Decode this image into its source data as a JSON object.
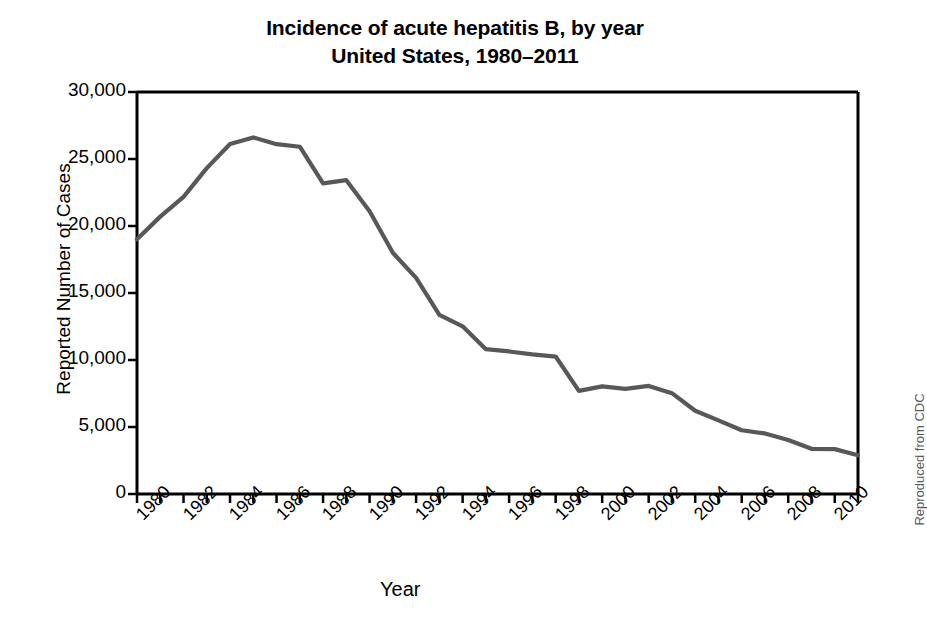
{
  "chart_data": {
    "type": "line",
    "title": "Incidence of acute hepatitis B, by year United States, 1980–2011",
    "title_lines": [
      "Incidence of acute hepatitis B, by year",
      "United States, 1980–2011"
    ],
    "xlabel": "Year",
    "ylabel": "Reported Number of Cases",
    "credit": "Reproduced from CDC",
    "xlim": [
      1980,
      2011
    ],
    "ylim": [
      0,
      30000
    ],
    "grid": false,
    "legend": null,
    "line_color": "#58585a",
    "axis_color": "#000000",
    "ytick_labels": [
      "30,000",
      "25,000",
      "20,000",
      "15,000",
      "10,000",
      "5,000",
      "0"
    ],
    "ytick_values": [
      30000,
      25000,
      20000,
      15000,
      10000,
      5000,
      0
    ],
    "xtick_labels": [
      "1980",
      "1982",
      "1984",
      "1986",
      "1988",
      "1990",
      "1992",
      "1994",
      "1996",
      "1998",
      "2000",
      "2002",
      "2004",
      "2006",
      "2008",
      "2010"
    ],
    "xtick_values": [
      1980,
      1982,
      1984,
      1986,
      1988,
      1990,
      1992,
      1994,
      1996,
      1998,
      2000,
      2002,
      2004,
      2006,
      2008,
      2010
    ],
    "x": [
      1980,
      1981,
      1982,
      1983,
      1984,
      1985,
      1986,
      1987,
      1988,
      1989,
      1990,
      1991,
      1992,
      1993,
      1994,
      1995,
      1996,
      1997,
      1998,
      1999,
      2000,
      2001,
      2002,
      2003,
      2004,
      2005,
      2006,
      2007,
      2008,
      2009,
      2010,
      2011
    ],
    "values": [
      19015,
      20700,
      22177,
      24318,
      26115,
      26611,
      26107,
      25916,
      23177,
      23419,
      21102,
      18003,
      16126,
      13361,
      12517,
      10805,
      10637,
      10416,
      10258,
      7694,
      8036,
      7844,
      8064,
      7526,
      6212,
      5494,
      4758,
      4519,
      4033,
      3371,
      3350,
      2890
    ],
    "annotations": []
  }
}
